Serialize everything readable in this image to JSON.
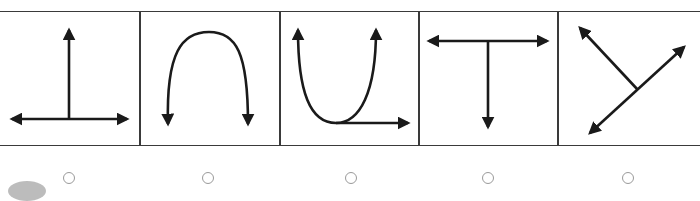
{
  "question": {
    "options": [
      {
        "id": "option-1",
        "shape": "inverted-T with arrows up, left, right",
        "icon": "inverted-t-arrows-icon"
      },
      {
        "id": "option-2",
        "shape": "arch curve with both ends arrowed down",
        "icon": "arch-down-arrows-icon"
      },
      {
        "id": "option-3",
        "shape": "U curve with arrows up and a right arrow at base",
        "icon": "u-curve-arrows-icon"
      },
      {
        "id": "option-4",
        "shape": "T with arrows left, right, down",
        "icon": "t-arrows-icon"
      },
      {
        "id": "option-5",
        "shape": "Y-like diagonal lines with three arrows",
        "icon": "y-diagonal-arrows-icon"
      }
    ]
  },
  "colors": {
    "stroke": "#1a1a1a",
    "border": "#3a3a3a",
    "radio": "#9a9a9a"
  }
}
